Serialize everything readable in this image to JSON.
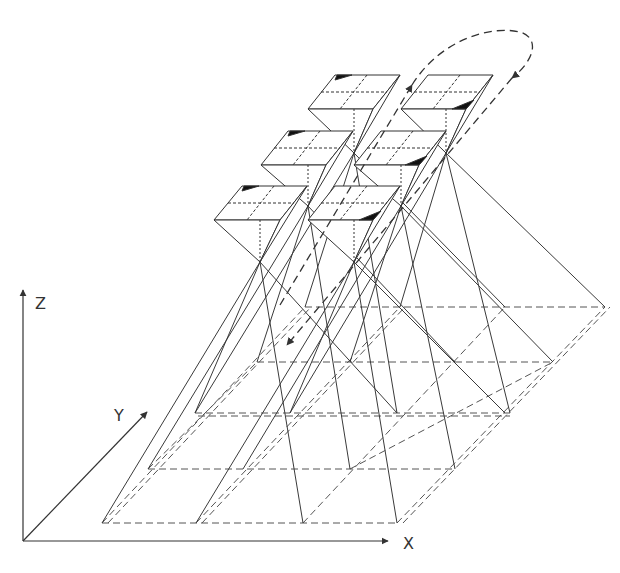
{
  "diagram": {
    "type": "multi-prism ray projection diagram",
    "axes": {
      "x_label": "X",
      "y_label": "Y",
      "z_label": "Z",
      "origin": [
        23,
        541
      ],
      "x_end": [
        388,
        541
      ],
      "y_end": [
        147,
        412
      ],
      "z_end": [
        23,
        290
      ]
    },
    "colors": {
      "line": "#3a3a3a",
      "fill_dark": "#111111",
      "background": "#ffffff"
    },
    "prisms": [
      {
        "id": "P1",
        "top": [
          [
            335,
            75
          ],
          [
            400,
            75
          ],
          [
            373,
            109
          ],
          [
            308,
            109
          ]
        ],
        "apex": [
          354,
          153
        ],
        "mark": "back-left"
      },
      {
        "id": "P2",
        "top": [
          [
            428,
            75
          ],
          [
            493,
            75
          ],
          [
            466,
            109
          ],
          [
            401,
            109
          ]
        ],
        "apex": [
          446,
          153
        ],
        "mark": "front-right"
      },
      {
        "id": "P3",
        "top": [
          [
            288,
            131
          ],
          [
            353,
            131
          ],
          [
            326,
            165
          ],
          [
            261,
            165
          ]
        ],
        "apex": [
          308,
          206
        ],
        "mark": "back-left"
      },
      {
        "id": "P4",
        "top": [
          [
            381,
            131
          ],
          [
            446,
            131
          ],
          [
            419,
            165
          ],
          [
            354,
            165
          ]
        ],
        "apex": [
          401,
          206
        ],
        "mark": "front-right"
      },
      {
        "id": "P5",
        "top": [
          [
            242,
            186
          ],
          [
            307,
            186
          ],
          [
            280,
            220
          ],
          [
            214,
            220
          ]
        ],
        "apex": [
          260,
          262
        ],
        "mark": "back-left"
      },
      {
        "id": "P6",
        "top": [
          [
            335,
            186
          ],
          [
            400,
            186
          ],
          [
            373,
            220
          ],
          [
            308,
            220
          ]
        ],
        "apex": [
          354,
          262
        ],
        "mark": "front-right"
      }
    ],
    "ground_levels_y": [
      307,
      362,
      413,
      469,
      523
    ],
    "motion_path": "dashed loop with arrows indicating scanning direction"
  }
}
